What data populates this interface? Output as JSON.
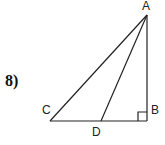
{
  "problem": {
    "number": "8)"
  },
  "figure": {
    "labels": {
      "A": "A",
      "B": "B",
      "C": "C",
      "D": "D"
    },
    "points": {
      "A": [
        147,
        15
      ],
      "B": [
        147,
        121
      ],
      "C": [
        50,
        121
      ],
      "D": [
        101,
        121
      ]
    },
    "right_angle_at": "B",
    "segments": [
      "AC",
      "AD",
      "AB",
      "CB"
    ],
    "line_color": "#222222"
  }
}
